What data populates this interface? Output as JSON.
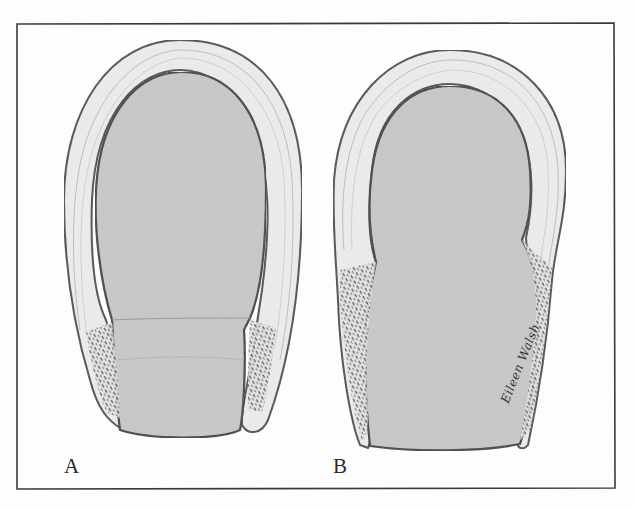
{
  "figure": {
    "panels": [
      {
        "id": "A",
        "label": "A",
        "description": "Rounded U-shaped wall with uniform lumen, flared textured lower ends"
      },
      {
        "id": "B",
        "label": "B",
        "description": "U-shaped wall with constricted waist and elongated textured lower walls"
      }
    ],
    "signature": "Eileen Walsh",
    "colors": {
      "background": "#fdfdfd",
      "frame": "#3a3a3a",
      "lumen_fill": "#c9c9c9",
      "wall_fill": "#eeeeee",
      "outline": "#4a4a4a",
      "stipple": "#555555"
    }
  }
}
